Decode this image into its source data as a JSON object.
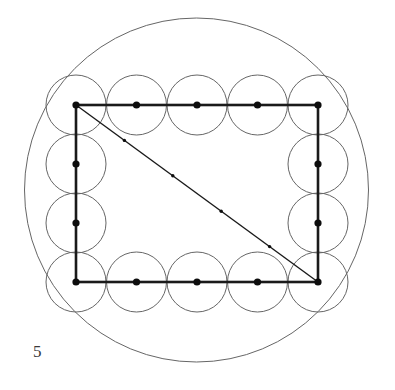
{
  "figure": {
    "caption": "5",
    "background_color": "#ffffff",
    "stroke_color_thin": "#666666",
    "stroke_color_thick": "#1a1a1a",
    "dot_color": "#0d0d0d",
    "outer_circle": {
      "label": "outer-circle",
      "cx": 196.5,
      "cy": 190,
      "r": 172,
      "stroke_width": 1
    },
    "rectangle": {
      "label": "inscribed-rectangle",
      "x": 76,
      "y": 105,
      "width": 242,
      "height": 177,
      "stroke_width": 2.6
    },
    "diagonal": {
      "label": "rectangle-diagonal",
      "x1": 76,
      "y1": 105,
      "x2": 318,
      "y2": 282,
      "stroke_width": 1.4
    },
    "small_circle_radius": 30,
    "small_circle_stroke_width": 1,
    "vertex_dot_radius": 3.6,
    "diagonal_dot_radius": 1.7,
    "perimeter_points": [
      {
        "name": "top-left-corner",
        "x": 76,
        "y": 105,
        "circle": true,
        "dot": true
      },
      {
        "name": "top-edge-1",
        "x": 136.5,
        "y": 105,
        "circle": true,
        "dot": true
      },
      {
        "name": "top-edge-2",
        "x": 197,
        "y": 105,
        "circle": true,
        "dot": true
      },
      {
        "name": "top-edge-3",
        "x": 257.5,
        "y": 105,
        "circle": true,
        "dot": true
      },
      {
        "name": "top-right-corner",
        "x": 318,
        "y": 105,
        "circle": true,
        "dot": true
      },
      {
        "name": "right-edge-1",
        "x": 318,
        "y": 164,
        "circle": true,
        "dot": true
      },
      {
        "name": "right-edge-2",
        "x": 318,
        "y": 223,
        "circle": true,
        "dot": true
      },
      {
        "name": "bottom-right-corner",
        "x": 318,
        "y": 282,
        "circle": true,
        "dot": true
      },
      {
        "name": "bottom-edge-3",
        "x": 257.5,
        "y": 282,
        "circle": true,
        "dot": true
      },
      {
        "name": "bottom-edge-2",
        "x": 197,
        "y": 282,
        "circle": true,
        "dot": true
      },
      {
        "name": "bottom-edge-1",
        "x": 136.5,
        "y": 282,
        "circle": true,
        "dot": true
      },
      {
        "name": "bottom-left-corner",
        "x": 76,
        "y": 282,
        "circle": true,
        "dot": true
      },
      {
        "name": "left-edge-2",
        "x": 76,
        "y": 223,
        "circle": true,
        "dot": true
      },
      {
        "name": "left-edge-1",
        "x": 76,
        "y": 164,
        "circle": true,
        "dot": true
      }
    ],
    "diagonal_points": [
      {
        "name": "diagonal-point-1",
        "x": 124.4,
        "y": 140.4
      },
      {
        "name": "diagonal-point-2",
        "x": 172.8,
        "y": 175.8
      },
      {
        "name": "diagonal-point-3",
        "x": 221.2,
        "y": 211.2
      },
      {
        "name": "diagonal-point-4",
        "x": 269.6,
        "y": 246.6
      }
    ]
  }
}
